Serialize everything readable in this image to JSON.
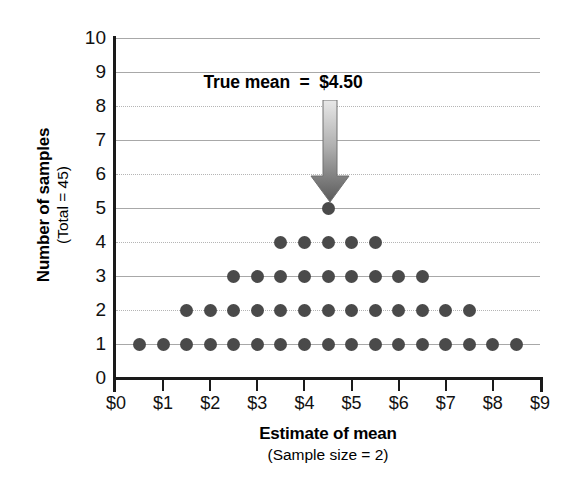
{
  "chart_data": {
    "type": "scatter",
    "title": "",
    "xlabel": "Estimate of mean",
    "xlabel_sub": "(Sample size = 2)",
    "ylabel": "Number of samples",
    "ylabel_sub": "(Total = 45)",
    "xlim": [
      0,
      9
    ],
    "ylim": [
      0,
      10
    ],
    "grid": true,
    "legend": "none",
    "x_tick_labels": [
      "$0",
      "$1",
      "$2",
      "$3",
      "$4",
      "$5",
      "$6",
      "$7",
      "$8",
      "$9"
    ],
    "x_tick_values": [
      0,
      1,
      2,
      3,
      4,
      5,
      6,
      7,
      8,
      9
    ],
    "y_tick_labels": [
      "0",
      "1",
      "2",
      "3",
      "4",
      "5",
      "6",
      "7",
      "8",
      "9",
      "10"
    ],
    "y_tick_values": [
      0,
      1,
      2,
      3,
      4,
      5,
      6,
      7,
      8,
      9,
      10
    ],
    "total_samples": 45,
    "dot_color": "#4a4a4a",
    "stacks": [
      {
        "x": 0.5,
        "count": 1
      },
      {
        "x": 1.0,
        "count": 1
      },
      {
        "x": 1.5,
        "count": 2
      },
      {
        "x": 2.0,
        "count": 2
      },
      {
        "x": 2.5,
        "count": 3
      },
      {
        "x": 3.0,
        "count": 3
      },
      {
        "x": 3.5,
        "count": 4
      },
      {
        "x": 4.0,
        "count": 4
      },
      {
        "x": 4.5,
        "count": 5
      },
      {
        "x": 5.0,
        "count": 4
      },
      {
        "x": 5.5,
        "count": 4
      },
      {
        "x": 6.0,
        "count": 3
      },
      {
        "x": 6.5,
        "count": 3
      },
      {
        "x": 7.0,
        "count": 2
      },
      {
        "x": 7.5,
        "count": 2
      },
      {
        "x": 8.0,
        "count": 1
      },
      {
        "x": 8.5,
        "count": 1
      }
    ],
    "rows": [
      {
        "y": 1,
        "x_values": [
          0.5,
          1.0,
          1.5,
          2.0,
          2.5,
          3.0,
          3.5,
          4.0,
          4.5,
          5.0,
          5.5,
          6.0,
          6.5,
          7.0,
          7.5,
          8.0,
          8.5
        ]
      },
      {
        "y": 2,
        "x_values": [
          1.5,
          2.0,
          2.5,
          3.0,
          3.5,
          4.0,
          4.5,
          5.0,
          5.5,
          6.0,
          6.5,
          7.0,
          7.5
        ]
      },
      {
        "y": 3,
        "x_values": [
          2.5,
          3.0,
          3.5,
          4.0,
          4.5,
          5.0,
          5.5,
          6.0,
          6.5
        ]
      },
      {
        "y": 4,
        "x_values": [
          3.5,
          4.0,
          4.5,
          5.0,
          5.5
        ]
      },
      {
        "y": 5,
        "x_values": [
          4.5
        ]
      }
    ],
    "annotations": [
      {
        "text": "True mean  =  $4.50",
        "label": "True mean",
        "equals": "=",
        "value": "$4.50",
        "points_to_x": 4.5,
        "points_to_y": 5,
        "arrow": "down-arrow"
      }
    ]
  }
}
